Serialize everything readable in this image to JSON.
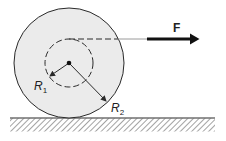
{
  "diagram": {
    "type": "physics-free-body",
    "colors": {
      "background": "#ffffff",
      "disc_fill": "#ebebeb",
      "stroke": "#2a2a2a",
      "string": "#9a9a9a",
      "arrow": "#111111"
    },
    "outer_circle": {
      "cx": 69,
      "cy": 63,
      "r": 55
    },
    "inner_circle": {
      "cx": 69,
      "cy": 63,
      "r": 24,
      "style": "dashed"
    },
    "center_dot": {
      "cx": 69,
      "cy": 63,
      "r": 2.2
    },
    "force": {
      "label": "F",
      "y": 39,
      "string_start_x": 69,
      "dashed_end_x": 118,
      "thick_start_x": 146,
      "tip_x": 199
    },
    "radii": [
      {
        "label": "R",
        "subscript": "1",
        "to": [
          50,
          76
        ]
      },
      {
        "label": "R",
        "subscript": "2",
        "to": [
          106,
          101
        ]
      }
    ],
    "ground": {
      "y": 118,
      "x1": 10,
      "x2": 215,
      "hatch_depth": 13
    }
  }
}
